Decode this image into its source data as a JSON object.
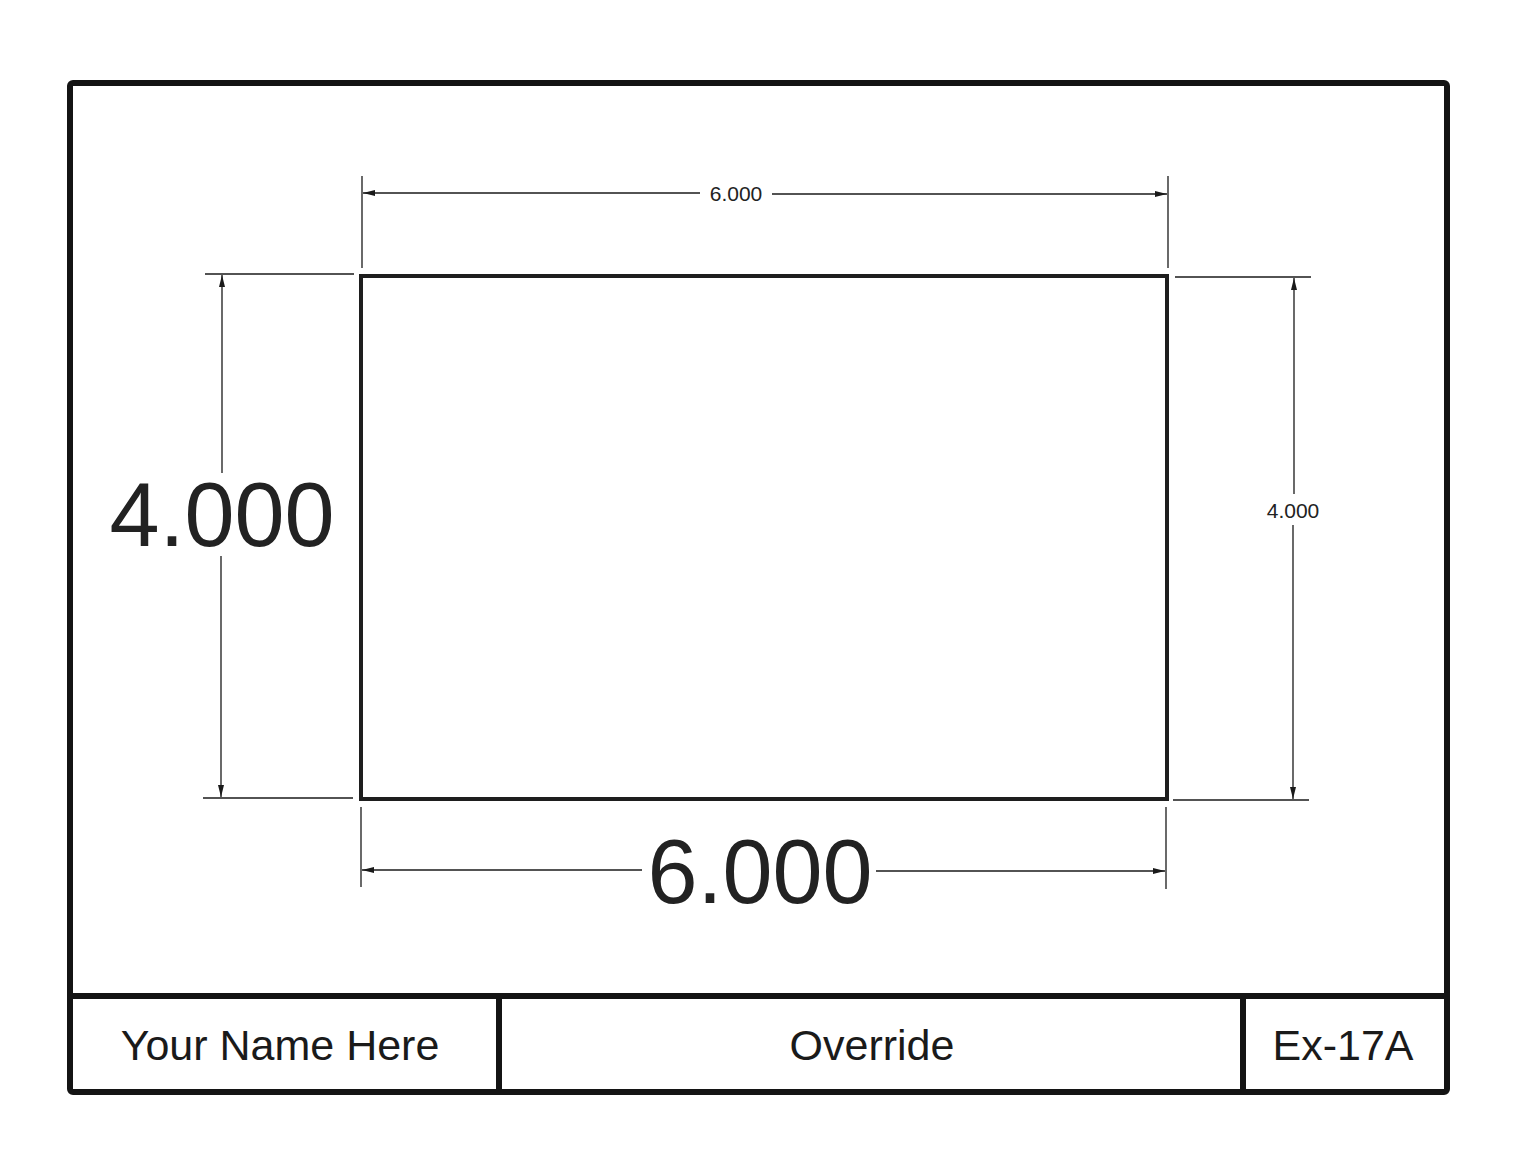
{
  "sheet": {
    "colors": {
      "background": "#ffffff",
      "ink": "#1a1a1a",
      "dim_text": "#222222"
    }
  },
  "part": {
    "shape": "rectangle",
    "width": "6.000",
    "height": "4.000"
  },
  "dimensions": {
    "top_width": {
      "label": "6.000",
      "size": "small"
    },
    "bottom_width": {
      "label": "6.000",
      "size": "large"
    },
    "left_height": {
      "label": "4.000",
      "size": "large"
    },
    "right_height": {
      "label": "4.000",
      "size": "small"
    }
  },
  "title_block": {
    "name": "Your Name Here",
    "title": "Override",
    "drawing_number": "Ex-17A"
  }
}
